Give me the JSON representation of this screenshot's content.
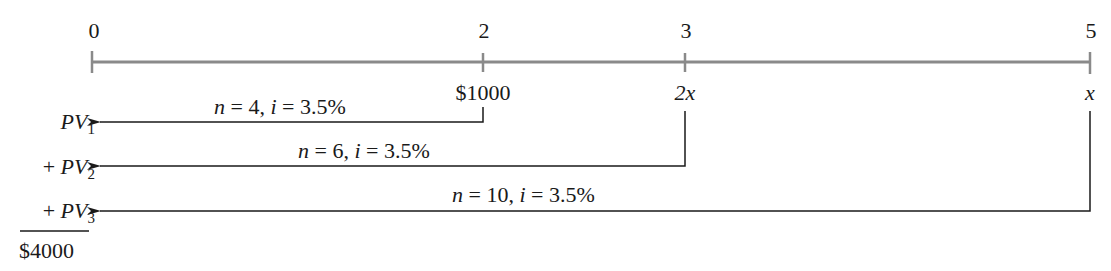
{
  "timeline": {
    "periods": [
      {
        "label": "0",
        "x": 92
      },
      {
        "label": "2",
        "x": 483
      },
      {
        "label": "3",
        "x": 685
      },
      {
        "label": "5",
        "x": 1090
      }
    ],
    "payments": [
      {
        "period": "2",
        "amount": "$1000"
      },
      {
        "period": "3",
        "amount": "2x"
      },
      {
        "period": "5",
        "amount": "x"
      }
    ]
  },
  "arrows": [
    {
      "label_n": "n",
      "n_value": "4",
      "label_i": "i",
      "i_value": "3.5%",
      "target": "PV",
      "sub": "1",
      "prefix": ""
    },
    {
      "label_n": "n",
      "n_value": "6",
      "label_i": "i",
      "i_value": "3.5%",
      "target": "PV",
      "sub": "2",
      "prefix": "+ "
    },
    {
      "label_n": "n",
      "n_value": "10",
      "label_i": "i",
      "i_value": "3.5%",
      "target": "PV",
      "sub": "3",
      "prefix": "+ "
    }
  ],
  "total": "$4000",
  "colors": {
    "timeline": "#8a8a8a",
    "ink": "#1a1a1a"
  }
}
